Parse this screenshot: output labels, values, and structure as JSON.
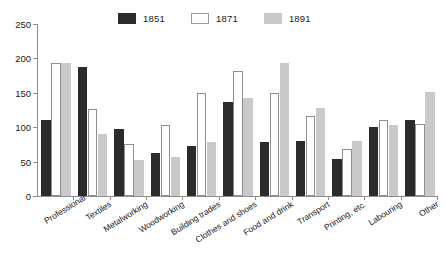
{
  "chart_data": {
    "type": "bar",
    "title": "",
    "subtitle": "",
    "xlabel": "",
    "ylabel": "",
    "ylim": [
      0,
      250
    ],
    "yticks": [
      0,
      50,
      100,
      150,
      200,
      250
    ],
    "grid": false,
    "legend_position": "top-center",
    "categories": [
      "Professional",
      "Textiles",
      "Metalworking",
      "Woodworking",
      "Building trades",
      "Clothes and shoes",
      "Food and drink",
      "Transport",
      "Printing, etc.",
      "Labouring",
      "Other"
    ],
    "series": [
      {
        "name": "1851",
        "color": "#2b2b2b",
        "values": [
          110,
          188,
          98,
          62,
          73,
          136,
          78,
          80,
          54,
          100,
          111
        ]
      },
      {
        "name": "1871",
        "color": "#ffffff",
        "values": [
          193,
          127,
          75,
          103,
          150,
          181,
          150,
          116,
          69,
          110,
          105
        ]
      },
      {
        "name": "1891",
        "color": "#c9c9c9",
        "values": [
          193,
          90,
          52,
          57,
          79,
          143,
          194,
          128,
          80,
          103,
          151
        ]
      }
    ]
  },
  "legend": {
    "entries": [
      {
        "label": "1851",
        "swatch": "black"
      },
      {
        "label": "1871",
        "swatch": "white"
      },
      {
        "label": "1891",
        "swatch": "gray"
      }
    ]
  },
  "axis": {
    "y_tick_labels": [
      "250",
      "200",
      "150",
      "100",
      "50",
      "0"
    ]
  },
  "colors": {
    "series_1851": "#2b2b2b",
    "series_1871": "#ffffff",
    "series_1891": "#c9c9c9",
    "axis": "#8d8d8d",
    "text": "#1a1a1a",
    "background": "#ffffff"
  }
}
